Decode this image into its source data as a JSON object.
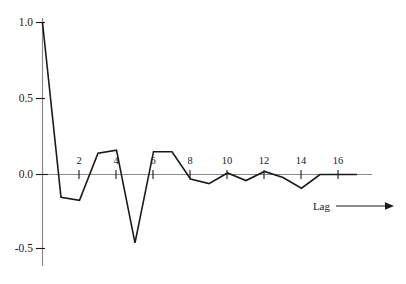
{
  "chart_data": {
    "type": "line",
    "title": "",
    "subtitle": "",
    "xlabel": "Lag",
    "ylabel": "",
    "x": [
      0,
      1,
      2,
      3,
      4,
      5,
      6,
      7,
      8,
      9,
      10,
      11,
      12,
      13,
      14,
      15,
      16,
      17
    ],
    "values": [
      1.0,
      -0.15,
      -0.17,
      0.14,
      0.16,
      -0.45,
      0.15,
      0.15,
      -0.03,
      -0.06,
      0.01,
      -0.04,
      0.02,
      -0.02,
      -0.09,
      0.0,
      0.0,
      0.0
    ],
    "series": [
      {
        "name": "autocorrelation",
        "values": [
          1.0,
          -0.15,
          -0.17,
          0.14,
          0.16,
          -0.45,
          0.15,
          0.15,
          -0.03,
          -0.06,
          0.01,
          -0.04,
          0.02,
          -0.02,
          -0.09,
          0.0,
          0.0,
          0.0
        ]
      }
    ],
    "ylim": [
      -0.62,
      1.0
    ],
    "xlim": [
      0,
      19
    ],
    "yticks": [
      1.0,
      0.5,
      0.0,
      -0.5
    ],
    "ytick_labels": [
      "1.0",
      "0.5",
      "0.0",
      "-0.5"
    ],
    "xticks": [
      2,
      4,
      6,
      8,
      10,
      12,
      14,
      16
    ],
    "xtick_labels": [
      "2",
      "4",
      "6",
      "8",
      "10",
      "12",
      "14",
      "16"
    ],
    "grid": false,
    "legend": "none",
    "axis_arrow": true,
    "line_color": "#1a1a1a",
    "axis_color": "#555555"
  },
  "axes": {
    "x_axis_name": "Lag",
    "y_tick_0": "1.0",
    "y_tick_1": "0.5",
    "y_tick_2": "0.0",
    "y_tick_3": "-0.5",
    "x_tick_0": "2",
    "x_tick_1": "4",
    "x_tick_2": "6",
    "x_tick_3": "8",
    "x_tick_4": "10",
    "x_tick_5": "12",
    "x_tick_6": "14",
    "x_tick_7": "16"
  }
}
